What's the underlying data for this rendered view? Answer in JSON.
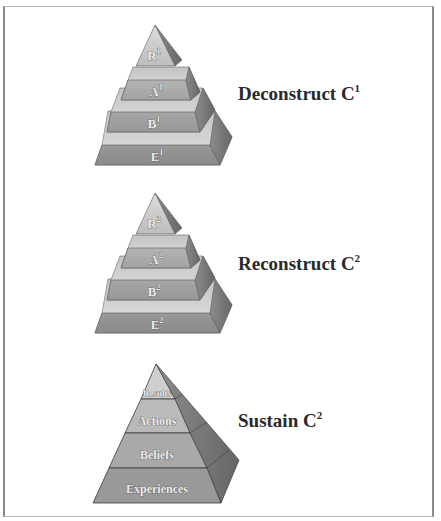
{
  "diagram": {
    "pyramids": [
      {
        "name": "deconstruct",
        "stage_label": "Deconstruct C",
        "stage_superscript": "1",
        "tiers": [
          {
            "letter": "R",
            "sup": "1"
          },
          {
            "letter": "A",
            "sup": "1"
          },
          {
            "letter": "B",
            "sup": "1"
          },
          {
            "letter": "E",
            "sup": "1"
          }
        ]
      },
      {
        "name": "reconstruct",
        "stage_label": "Reconstruct C",
        "stage_superscript": "2",
        "tiers": [
          {
            "letter": "R",
            "sup": "2"
          },
          {
            "letter": "A",
            "sup": "2"
          },
          {
            "letter": "B",
            "sup": "2"
          },
          {
            "letter": "E",
            "sup": "2"
          }
        ]
      },
      {
        "name": "sustain",
        "stage_label": "Sustain C",
        "stage_superscript": "2",
        "tiers": [
          {
            "label": "Results"
          },
          {
            "label": "Actions"
          },
          {
            "label": "Beliefs"
          },
          {
            "label": "Experiences"
          }
        ]
      }
    ],
    "colors": {
      "frame": "#8a8a8a",
      "stage_text": "#2a2a2a",
      "tier_text": "#ececec",
      "face_light": "#d6d6d6",
      "face_mid": "#a8a8a8",
      "face_dark": "#7a7a7a"
    }
  }
}
